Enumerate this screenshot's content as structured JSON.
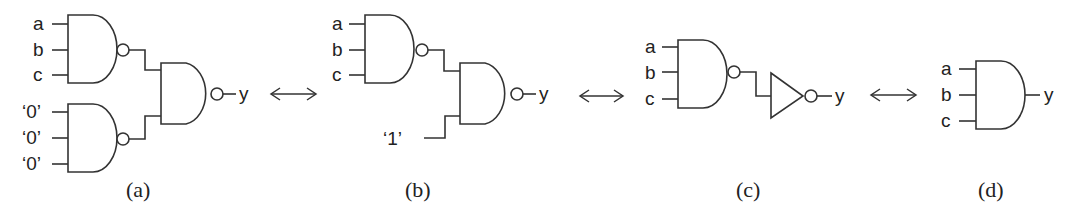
{
  "figure": {
    "panels": [
      {
        "caption": "(a)",
        "inputs_top": [
          "a",
          "b",
          "c"
        ],
        "inputs_bottom": [
          "‘0’",
          "‘0’",
          "‘0’"
        ],
        "output": "y",
        "gates": [
          "NAND3",
          "NAND3",
          "NAND2"
        ]
      },
      {
        "caption": "(b)",
        "inputs_top": [
          "a",
          "b",
          "c"
        ],
        "constant_input": "‘1’",
        "output": "y",
        "gates": [
          "NAND3",
          "NAND2"
        ]
      },
      {
        "caption": "(c)",
        "inputs_top": [
          "a",
          "b",
          "c"
        ],
        "output": "y",
        "gates": [
          "NAND3",
          "NOT"
        ]
      },
      {
        "caption": "(d)",
        "inputs_top": [
          "a",
          "b",
          "c"
        ],
        "output": "y",
        "gates": [
          "AND3"
        ]
      }
    ],
    "equivalence_symbol": "double-arrow",
    "colors": {
      "line": "#333333",
      "text": "#222222",
      "background": "#ffffff"
    }
  }
}
